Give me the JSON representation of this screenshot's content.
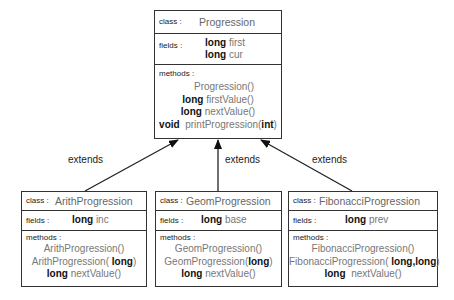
{
  "diagram": {
    "connector_label": "extends",
    "classes": [
      {
        "id": "progression",
        "class_label": "class :",
        "name": "Progression",
        "fields_label": "fields :",
        "fields": [
          {
            "type": "long",
            "name": "first"
          },
          {
            "type": "long",
            "name": "cur"
          }
        ],
        "methods_label": "methods :",
        "methods": [
          {
            "ret": "",
            "name": "Progression()",
            "arg": "",
            "close": ""
          },
          {
            "ret": "long",
            "name": "firstValue()",
            "arg": "",
            "close": ""
          },
          {
            "ret": "long",
            "name": "nextValue()",
            "arg": "",
            "close": ""
          },
          {
            "ret": "void",
            "name": "printProgression(",
            "arg": "int",
            "close": ")"
          }
        ]
      },
      {
        "id": "arith",
        "class_label": "class :",
        "name": "ArithProgression",
        "fields_label": "fields :",
        "fields": [
          {
            "type": "long",
            "name": "inc"
          }
        ],
        "methods_label": "methods :",
        "methods": [
          {
            "ret": "",
            "name": "ArithProgression()",
            "arg": "",
            "close": ""
          },
          {
            "ret": "",
            "name": "ArithProgression(",
            "arg": "long",
            "close": ")"
          },
          {
            "ret": "long",
            "name": "nextValue()",
            "arg": "",
            "close": ""
          }
        ]
      },
      {
        "id": "geom",
        "class_label": "class :",
        "name": "GeomProgression",
        "fields_label": "fields :",
        "fields": [
          {
            "type": "long",
            "name": "base"
          }
        ],
        "methods_label": "methods :",
        "methods": [
          {
            "ret": "",
            "name": "GeomProgression()",
            "arg": "",
            "close": ""
          },
          {
            "ret": "",
            "name": "GeomProgression(",
            "arg": "long",
            "close": ")"
          },
          {
            "ret": "long",
            "name": "nextValue()",
            "arg": "",
            "close": ""
          }
        ]
      },
      {
        "id": "fib",
        "class_label": "class :",
        "name": "FibonacciProgression",
        "fields_label": "fields :",
        "fields": [
          {
            "type": "long",
            "name": "prev"
          }
        ],
        "methods_label": "methods :",
        "methods": [
          {
            "ret": "",
            "name": "FibonacciProgression()",
            "arg": "",
            "close": ""
          },
          {
            "ret": "",
            "name": "FibonacciProgression(",
            "arg": "long,long",
            "close": ")"
          },
          {
            "ret": "long",
            "name": "nextValue()",
            "arg": "",
            "close": ""
          }
        ]
      }
    ],
    "edges": [
      {
        "from": "arith",
        "to": "progression",
        "label": "extends"
      },
      {
        "from": "geom",
        "to": "progression",
        "label": "extends"
      },
      {
        "from": "fib",
        "to": "progression",
        "label": "extends"
      }
    ]
  }
}
